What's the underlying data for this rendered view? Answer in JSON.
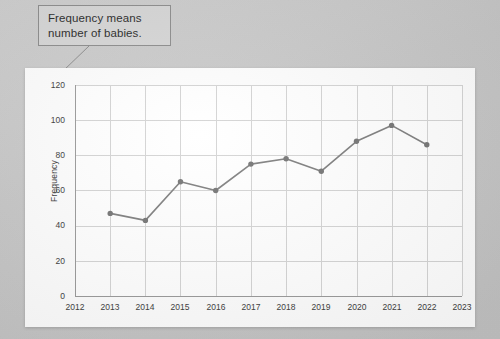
{
  "callout": {
    "line1": "Frequency means",
    "line2": "number of babies."
  },
  "chart_data": {
    "type": "line",
    "title": "",
    "subtitle": "",
    "xlabel": "",
    "ylabel": "Frequency",
    "grid": true,
    "legend": "none",
    "xlim": [
      2012,
      2023
    ],
    "ylim": [
      0,
      120
    ],
    "x_ticks": [
      "2012",
      "2013",
      "2014",
      "2015",
      "2016",
      "2017",
      "2018",
      "2019",
      "2020",
      "2021",
      "2022",
      "2023"
    ],
    "y_ticks": [
      "0",
      "20",
      "40",
      "60",
      "80",
      "100",
      "120"
    ],
    "x": [
      2013,
      2014,
      2015,
      2016,
      2017,
      2018,
      2019,
      2020,
      2021,
      2022
    ],
    "categories": [
      "2013",
      "2014",
      "2015",
      "2016",
      "2017",
      "2018",
      "2019",
      "2020",
      "2021",
      "2022"
    ],
    "values": [
      47,
      43,
      65,
      60,
      75,
      78,
      71,
      88,
      97,
      86
    ],
    "series": [
      {
        "name": "Frequency",
        "values": [
          47,
          43,
          65,
          60,
          75,
          78,
          71,
          88,
          97,
          86
        ]
      }
    ],
    "line_color": "#7f7f7f",
    "marker_color": "#757575",
    "grid_color": "#d4d4d4",
    "axis_color": "#9a9a9a",
    "plot_background": "#ffffff"
  }
}
